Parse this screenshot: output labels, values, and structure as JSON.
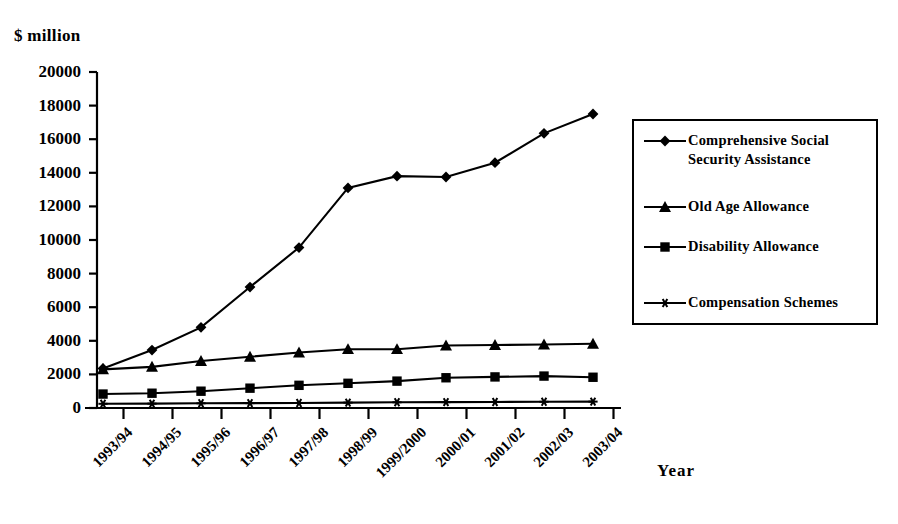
{
  "chart_data": {
    "type": "line",
    "title": "",
    "xlabel": "Year",
    "ylabel": "$ million",
    "ylim": [
      0,
      20000
    ],
    "ytick_step": 2000,
    "grid": false,
    "legend_position": "right",
    "categories": [
      "1993/94",
      "1994/95",
      "1995/96",
      "1996/97",
      "1997/98",
      "1998/99",
      "1999/2000",
      "2000/01",
      "2001/02",
      "2002/03",
      "2003/04"
    ],
    "ytick_labels": [
      "20000",
      "18000",
      "16000",
      "14000",
      "12000",
      "10000",
      "8000",
      "6000",
      "4000",
      "2000",
      "0"
    ],
    "series": [
      {
        "name": "Comprehensive Social Security Assistance",
        "marker": "diamond",
        "values": [
          2350,
          3450,
          4800,
          7200,
          9550,
          13100,
          13800,
          13750,
          14600,
          16350,
          17500
        ]
      },
      {
        "name": "Old Age Allowance",
        "marker": "triangle",
        "values": [
          2300,
          2450,
          2800,
          3050,
          3300,
          3500,
          3500,
          3720,
          3750,
          3780,
          3820
        ]
      },
      {
        "name": "Disability Allowance",
        "marker": "square",
        "values": [
          830,
          880,
          1000,
          1180,
          1350,
          1470,
          1600,
          1800,
          1850,
          1900,
          1830
        ]
      },
      {
        "name": "Compensation Schemes",
        "marker": "star",
        "values": [
          250,
          260,
          280,
          290,
          300,
          320,
          340,
          350,
          360,
          370,
          380
        ]
      }
    ]
  },
  "legend": {
    "items": [
      {
        "label": "Comprehensive Social\nSecurity Assistance",
        "marker": "diamond"
      },
      {
        "label": "Old Age Allowance",
        "marker": "triangle"
      },
      {
        "label": "Disability Allowance",
        "marker": "square"
      },
      {
        "label": "Compensation Schemes",
        "marker": "star"
      }
    ]
  },
  "colors": {
    "ink": "#000000",
    "background": "#ffffff"
  }
}
